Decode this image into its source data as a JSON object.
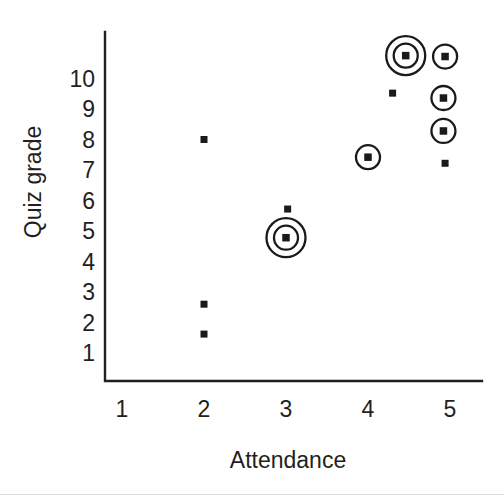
{
  "chart_data": {
    "type": "scatter",
    "title": "",
    "xlabel": "Attendance",
    "ylabel": "Quiz grade",
    "xticks": [
      "1",
      "2",
      "3",
      "4",
      "5"
    ],
    "xtick_values": [
      1,
      2,
      3,
      4,
      5
    ],
    "yticks": [
      "1",
      "2",
      "3",
      "4",
      "5",
      "6",
      "7",
      "8",
      "9",
      "10"
    ],
    "ytick_values": [
      1,
      2,
      3,
      4,
      5,
      6,
      7,
      8,
      9,
      10
    ],
    "xlim": [
      0.8,
      5.35
    ],
    "ylim": [
      0.2,
      11.2
    ],
    "grid": false,
    "legend": false,
    "marker_color": "#1a1a1a",
    "axis_color": "#231f20",
    "points": [
      {
        "x": 2.0,
        "y": 8.0,
        "rings": 0
      },
      {
        "x": 2.0,
        "y": 2.6,
        "rings": 0
      },
      {
        "x": 2.0,
        "y": 1.62,
        "rings": 0
      },
      {
        "x": 3.02,
        "y": 5.72,
        "rings": 0
      },
      {
        "x": 3.0,
        "y": 4.78,
        "rings": 2
      },
      {
        "x": 4.0,
        "y": 7.42,
        "rings": 1
      },
      {
        "x": 4.3,
        "y": 9.52,
        "rings": 0
      },
      {
        "x": 4.46,
        "y": 10.75,
        "rings": 2
      },
      {
        "x": 4.94,
        "y": 10.72,
        "rings": 1
      },
      {
        "x": 4.92,
        "y": 9.36,
        "rings": 1
      },
      {
        "x": 4.92,
        "y": 8.28,
        "rings": 1
      },
      {
        "x": 4.94,
        "y": 7.22,
        "rings": 0
      }
    ]
  },
  "axes": {
    "x_title": "Attendance",
    "y_title": "Quiz grade"
  }
}
